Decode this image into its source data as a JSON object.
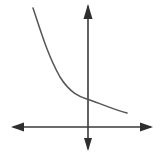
{
  "figure": {
    "kind": "cartesian-coordinate-plane-with-curve",
    "width": 163,
    "height": 160,
    "background_color": "#ffffff",
    "title": "",
    "caption": ""
  },
  "style": {
    "axis_color": "#3a3a3a",
    "axis_stroke_width": 1.6,
    "arrow_color": "#2e2e2e",
    "curve_color": "#555555",
    "curve_stroke_width": 1.5
  },
  "axes": {
    "origin": {
      "x": 88,
      "y": 127
    },
    "x_axis": {
      "label": "",
      "line": {
        "x1": 13,
        "y1": 127,
        "x2": 151,
        "y2": 127
      },
      "arrow_left": {
        "tip_x": 11,
        "tip_y": 127,
        "base_x": 24,
        "half_width": 4.5
      },
      "arrow_right": {
        "tip_x": 153,
        "tip_y": 127,
        "base_x": 140,
        "half_width": 4.5
      },
      "ticks": [],
      "tick_labels": []
    },
    "y_axis": {
      "label": "",
      "line": {
        "x1": 88,
        "y1": 6,
        "x2": 88,
        "y2": 149
      },
      "arrow_up": {
        "tip_x": 88,
        "tip_y": 4,
        "base_y": 19,
        "half_width": 4.5
      },
      "arrow_down": {
        "tip_x": 88,
        "tip_y": 151,
        "base_y": 138,
        "half_width": 4.0
      },
      "ticks": [],
      "tick_labels": []
    },
    "grid": false,
    "legend": null
  },
  "chart_data": {
    "type": "line",
    "title": "",
    "xlabel": "",
    "ylabel": "",
    "grid": false,
    "legend": null,
    "series": [
      {
        "name": "decaying-exponential",
        "points_px": [
          [
            33,
            8
          ],
          [
            38,
            22
          ],
          [
            42,
            33
          ],
          [
            47,
            48
          ],
          [
            52,
            60
          ],
          [
            58,
            73
          ],
          [
            65,
            84
          ],
          [
            72,
            91
          ],
          [
            80,
            96
          ],
          [
            88,
            99
          ],
          [
            96,
            103
          ],
          [
            104,
            106
          ],
          [
            112,
            109
          ],
          [
            120,
            111
          ],
          [
            127,
            113
          ]
        ],
        "path_d": "M 33 8 C 41 32, 48 56, 60 77 C 70 93, 80 97, 88 99.5 C 102 104, 115 110, 127 113"
      }
    ],
    "endpoints": {
      "start_px": [
        33,
        8
      ],
      "end_px": [
        127,
        113
      ],
      "y_intercept_px": [
        88,
        99
      ]
    }
  },
  "annotations": []
}
